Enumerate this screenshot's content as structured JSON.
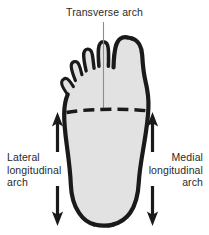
{
  "figure": {
    "colors": {
      "background": "#ffffff",
      "foot_fill": "#e2e2e2",
      "outline": "#1a1a1a",
      "leader_line": "#8c8c8c",
      "dashed_line": "#1a1a1a",
      "arrow": "#1a1a1a",
      "text": "#2a2a2a"
    }
  },
  "labels": {
    "transverse": {
      "text": "Transverse arch",
      "lines": [
        "Transverse arch"
      ]
    },
    "lateral": {
      "text": "Lateral longitudinal arch",
      "lines": [
        "Lateral",
        "longitudinal",
        "arch"
      ]
    },
    "medial": {
      "text": "Medial longitudinal arch",
      "lines": [
        "Medial",
        "longitudinal",
        "arch"
      ]
    }
  },
  "annotations": {
    "leader_line": "transverse-arch-leader",
    "dashed_line": "transverse-arch-dashed-line",
    "arrows": [
      {
        "name": "lateral-arrow-up",
        "direction": "up",
        "side": "left"
      },
      {
        "name": "lateral-arrow-down",
        "direction": "down",
        "side": "left"
      },
      {
        "name": "medial-arrow-up",
        "direction": "up",
        "side": "right"
      },
      {
        "name": "medial-arrow-down",
        "direction": "down",
        "side": "right"
      }
    ]
  }
}
